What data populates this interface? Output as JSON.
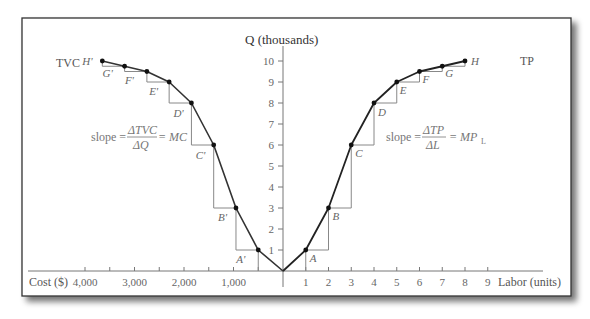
{
  "title": {
    "y_axis": "Q (thousands)",
    "x_axis_right": "Labor (units)",
    "x_axis_left": "Cost ($)"
  },
  "curves": {
    "tvc_label": "TVC",
    "tp_label": "TP"
  },
  "formulas": {
    "left": {
      "prefix": "slope = ",
      "numerator": "ΔTVC",
      "denominator": "ΔQ",
      "suffix": "= MC"
    },
    "right": {
      "prefix": "slope = ",
      "numerator": "ΔTP",
      "denominator": "ΔL",
      "suffix": "= MP",
      "suffix_sub": "L"
    }
  },
  "y_ticks": [
    "1",
    "2",
    "3",
    "4",
    "5",
    "6",
    "7",
    "8",
    "9",
    "10"
  ],
  "labor_ticks": [
    "1",
    "2",
    "3",
    "4",
    "5",
    "6",
    "7",
    "8",
    "9"
  ],
  "cost_ticks": [
    "4,000",
    "3,000",
    "2,000",
    "1,000"
  ],
  "colors": {
    "curve": "#222222",
    "steps": "#888888",
    "axis": "#777777",
    "text": "#666666",
    "frame": "#333333"
  },
  "chart_data": {
    "type": "line",
    "title": "",
    "series": [
      {
        "name": "TP",
        "x_label": "Labor (units)",
        "points": [
          {
            "label": "A",
            "labor": 1,
            "q": 1
          },
          {
            "label": "B",
            "labor": 2,
            "q": 3
          },
          {
            "label": "C",
            "labor": 3,
            "q": 6
          },
          {
            "label": "D",
            "labor": 4,
            "q": 8
          },
          {
            "label": "E",
            "labor": 5,
            "q": 9
          },
          {
            "label": "F",
            "labor": 6,
            "q": 9.5
          },
          {
            "label": "G",
            "labor": 7,
            "q": 9.75
          },
          {
            "label": "H",
            "labor": 8,
            "q": 10
          }
        ]
      },
      {
        "name": "TVC",
        "x_label": "Cost ($)",
        "points": [
          {
            "label": "A'",
            "cost": 500,
            "q": 1
          },
          {
            "label": "B'",
            "cost": 950,
            "q": 3
          },
          {
            "label": "C'",
            "cost": 1400,
            "q": 6
          },
          {
            "label": "D'",
            "cost": 1850,
            "q": 8
          },
          {
            "label": "E'",
            "cost": 2300,
            "q": 9
          },
          {
            "label": "F'",
            "cost": 2750,
            "q": 9.5
          },
          {
            "label": "G'",
            "cost": 3200,
            "q": 9.75
          },
          {
            "label": "H'",
            "cost": 3650,
            "q": 10
          }
        ]
      }
    ],
    "ylabel": "Q (thousands)",
    "ylim": [
      0,
      10
    ],
    "xlim_labor": [
      0,
      9
    ],
    "xlim_cost": [
      0,
      4000
    ],
    "annotations": [
      "slope = ΔTVC/ΔQ = MC",
      "slope = ΔTP/ΔL = MP_L"
    ]
  }
}
